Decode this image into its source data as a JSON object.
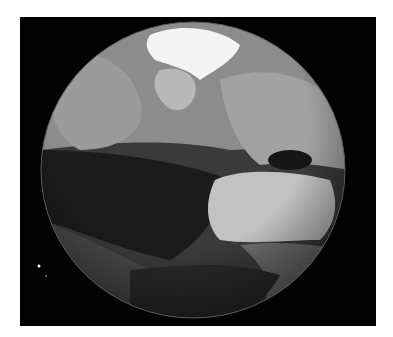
{
  "image": {
    "subject": "Earth globe (grayscale), Atlantic hemisphere view",
    "background_color": "#020202",
    "page_color": "#ffffff",
    "globe": {
      "cx": 193,
      "cy": 170,
      "rx": 152,
      "ry": 148
    },
    "regions": [
      {
        "name": "arctic-ice",
        "color": "#f4f4f4"
      },
      {
        "name": "greenland",
        "color": "#b8b8b8"
      },
      {
        "name": "north-atlantic",
        "color": "#8a8a8a"
      },
      {
        "name": "tropical-atlantic",
        "color": "#1a1a1a"
      },
      {
        "name": "africa",
        "color": "#c2c2c2"
      },
      {
        "name": "south-america",
        "color": "#9a9a9a"
      },
      {
        "name": "europe",
        "color": "#7a7a7a"
      },
      {
        "name": "southern-ocean",
        "color": "#2a2a2a"
      }
    ],
    "stars": [
      {
        "x": 39,
        "y": 266
      },
      {
        "x": 46,
        "y": 276
      }
    ]
  }
}
